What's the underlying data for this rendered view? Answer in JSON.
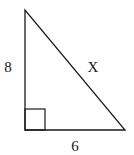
{
  "diagram": {
    "type": "right-triangle",
    "labels": {
      "left_side": "8",
      "hypotenuse": "X",
      "bottom_side": "6"
    },
    "right_angle_marker": true,
    "colors": {
      "stroke": "#1a1a1a",
      "background": "#ffffff"
    }
  }
}
